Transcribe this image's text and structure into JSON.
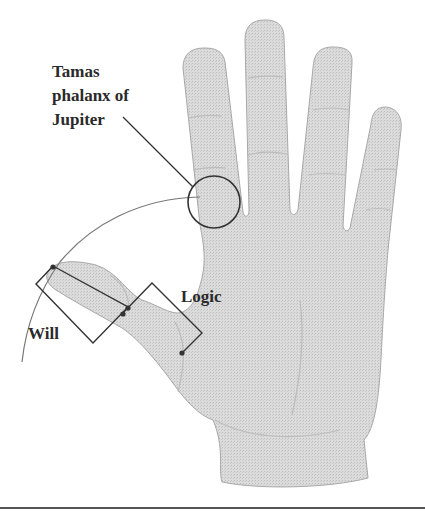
{
  "figure": {
    "labels": {
      "tamas": [
        "Tamas",
        "phalanx of",
        "Jupiter"
      ],
      "logic": "Logic",
      "will": "Will"
    },
    "colors": {
      "hand_fill": "#d9d9d9",
      "hand_edge": "#9a9a9a",
      "line": "#333333",
      "crease": "#bdbdbd",
      "rule": "#555555"
    }
  }
}
